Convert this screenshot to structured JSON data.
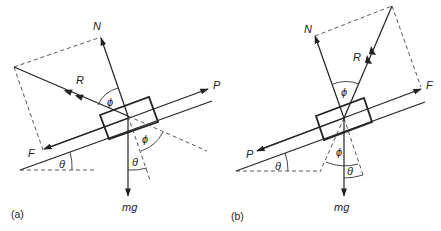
{
  "panels": [
    {
      "id": "a",
      "caption": "(a)",
      "labels": {
        "N": "N",
        "R": "R",
        "P": "P",
        "F": "F",
        "mg": "mg",
        "phi_top": "ϕ",
        "phi_right": "ϕ",
        "theta_incline": "θ",
        "theta_bottom": "θ"
      },
      "description": "Block on incline at angle θ; applied force P up the slope, friction F down the slope; resultant R of N and F makes angle ϕ with N"
    },
    {
      "id": "b",
      "caption": "(b)",
      "labels": {
        "N": "N",
        "R": "R",
        "P": "P",
        "F": "F",
        "mg": "mg",
        "phi_top": "ϕ",
        "phi_bottom": "ϕ",
        "theta_incline": "θ",
        "theta_bottom": "θ"
      },
      "description": "Block on incline at angle θ; applied force P down the slope, friction F up the slope; resultant R of N and F makes angle ϕ with N"
    }
  ]
}
